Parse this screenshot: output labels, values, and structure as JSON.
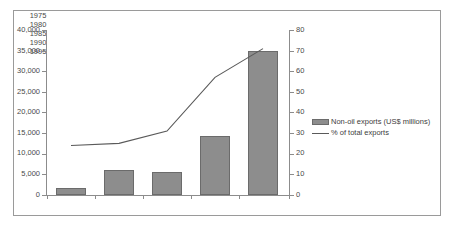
{
  "chart_data": {
    "type": "bar",
    "title": "",
    "subtitle": "",
    "xlabel": "",
    "categories": [
      "1975",
      "1980",
      "1985",
      "1990",
      "1995"
    ],
    "series": [
      {
        "name": "Non-oil exports (US$ millions)",
        "type": "bar",
        "axis": "left",
        "values": [
          1700,
          6000,
          5500,
          14400,
          34900
        ],
        "color": "#8d8d8d"
      },
      {
        "name": "% of total exports",
        "type": "line",
        "axis": "right",
        "values": [
          24,
          25,
          31,
          57,
          71
        ],
        "color": "#5a5a5a"
      }
    ],
    "left_axis": {
      "label": "",
      "ylim": [
        0,
        40000
      ],
      "ticks": [
        0,
        5000,
        10000,
        15000,
        20000,
        25000,
        30000,
        35000,
        40000
      ],
      "tick_labels": [
        "0",
        "5,000",
        "10,000",
        "15,000",
        "20,000",
        "25,000",
        "30,000",
        "35,000",
        "40,000"
      ]
    },
    "right_axis": {
      "label": "",
      "ylim": [
        0,
        80
      ],
      "ticks": [
        0,
        10,
        20,
        30,
        40,
        50,
        60,
        70,
        80
      ],
      "tick_labels": [
        "0",
        "10",
        "20",
        "30",
        "40",
        "50",
        "60",
        "70",
        "80"
      ]
    },
    "grid": false,
    "legend": {
      "position": "right",
      "entries": [
        {
          "label": "Non-oil exports (US$ millions)",
          "marker": "bar-swatch"
        },
        {
          "label": "% of total exports",
          "marker": "line-swatch"
        }
      ]
    }
  },
  "frame": {
    "border_color": "#9a9a9a",
    "background": "#ffffff"
  }
}
